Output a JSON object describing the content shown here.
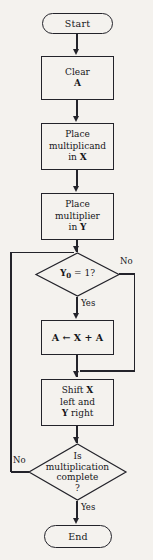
{
  "diagram": {
    "stroke_color": "#23232a",
    "background_color": "#f4f2ee",
    "nodes": [
      {
        "id": "start",
        "type": "terminator",
        "text": "Start"
      },
      {
        "id": "clear",
        "type": "process",
        "line1": "Clear",
        "line2": "A"
      },
      {
        "id": "place_x",
        "type": "process",
        "line1": "Place",
        "line2": "multiplicand",
        "line3": "in X"
      },
      {
        "id": "place_y",
        "type": "process",
        "line1": "Place",
        "line2": "multiplier",
        "line3": "in Y"
      },
      {
        "id": "test_y0",
        "type": "decision",
        "text": "Y0 = 1?"
      },
      {
        "id": "add",
        "type": "process",
        "text": "A ← X + A"
      },
      {
        "id": "shift",
        "type": "process",
        "line1": "Shift X",
        "line2": "left and",
        "line3": "Y right"
      },
      {
        "id": "test_done",
        "type": "decision",
        "line1": "Is",
        "line2": "multiplication",
        "line3": "complete",
        "line4": "?"
      },
      {
        "id": "end",
        "type": "terminator",
        "text": "End"
      }
    ],
    "edge_labels": {
      "y0_no": "No",
      "y0_yes": "Yes",
      "done_no": "No",
      "done_yes": "Yes"
    },
    "symbols": {
      "y_var": "Y",
      "y_subscript": "0",
      "x_var": "X",
      "a_var": "A",
      "assign_arrow": "←"
    }
  }
}
